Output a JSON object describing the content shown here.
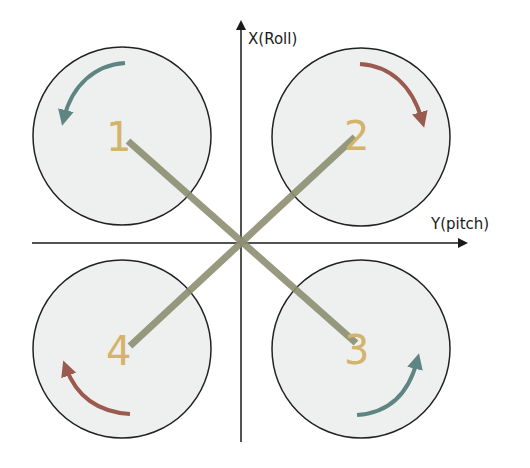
{
  "diagram": {
    "type": "quadcopter X-configuration top view",
    "axes": {
      "x_axis_label": "X(Roll)",
      "y_axis_label": "Y(pitch)"
    },
    "colors": {
      "axis": "#1a1a1a",
      "rotor_fill": "#eef0ef",
      "rotor_stroke": "#222222",
      "arm": "#8d8f72",
      "number": "#d4b46a",
      "arrow_ccw": "#5f8583",
      "arrow_cw": "#9a5a4f"
    },
    "motors": [
      {
        "id": "1",
        "label": "1",
        "position": "front-left",
        "rotation": "counter-clockwise",
        "arrow_color": "#5f8583"
      },
      {
        "id": "2",
        "label": "2",
        "position": "front-right",
        "rotation": "clockwise",
        "arrow_color": "#9a5a4f"
      },
      {
        "id": "3",
        "label": "3",
        "position": "rear-right",
        "rotation": "counter-clockwise",
        "arrow_color": "#5f8583"
      },
      {
        "id": "4",
        "label": "4",
        "position": "rear-left",
        "rotation": "clockwise",
        "arrow_color": "#9a5a4f"
      }
    ]
  }
}
